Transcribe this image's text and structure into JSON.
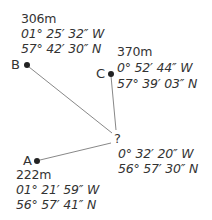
{
  "points": {
    "B": {
      "label": "B",
      "altitude": "306m",
      "longitude": "01° 25′ 32″ W",
      "latitude": "57° 42′ 30″ N"
    },
    "C": {
      "label": "C",
      "altitude": "370m",
      "longitude": "0° 52′ 44″ W",
      "latitude": "57° 39′ 03″ N"
    },
    "A": {
      "label": "A",
      "altitude": "222m",
      "longitude": "01° 21′ 59″ W",
      "latitude": "56° 57′ 41″ N"
    },
    "unknown": {
      "label": "?",
      "longitude": "0° 32′ 20″ W",
      "latitude": "56° 57′ 30″ N"
    }
  },
  "colors": {
    "text": "#333333",
    "line": "#888888",
    "dot": "#222222"
  }
}
